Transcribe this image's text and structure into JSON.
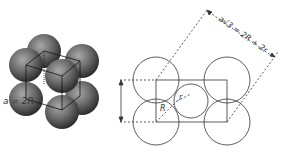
{
  "figure": {
    "left_panel": {
      "description": "3D sphere packing model with unit cube lines"
    },
    "right_panel": {
      "labels": {
        "edge": "a = 2R",
        "diagonal": "a√3 = 2R + 2r",
        "big_radius": "R",
        "small_radius": "r"
      }
    }
  },
  "colors": {
    "sphere": "#6e6e6e",
    "line": "#333333"
  }
}
